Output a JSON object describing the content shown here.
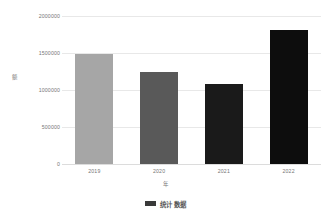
{
  "chart_data": {
    "type": "bar",
    "title": "",
    "categories": [
      "2019",
      "2020",
      "2021",
      "2022"
    ],
    "values": [
      1480000,
      1243000,
      1081000,
      1810000
    ],
    "series": [
      {
        "name": "",
        "values": [
          1480000,
          1243000,
          1081000,
          1810000
        ]
      }
    ],
    "xlabel": "年",
    "ylabel": "额",
    "ylim": [
      0,
      2000000
    ],
    "ytick_labels": [
      "0",
      "500000",
      "1000000",
      "1500000",
      "2000000"
    ],
    "ytick_values": [
      0,
      500000,
      1000000,
      1500000,
      2000000
    ],
    "xtick_labels": [
      "2019",
      "2020",
      "2021",
      "2022"
    ],
    "grid": true,
    "grid_axis": "y",
    "legend": "none",
    "bar_colors": [
      "#a6a6a6",
      "#595959",
      "#1a1a1a",
      "#0d0d0d"
    ]
  },
  "axes": {
    "y_title_chars": [
      "额"
    ],
    "x_title": "年"
  },
  "caption": {
    "text": "统计 数据",
    "swatch_color": "#3a3a3a"
  },
  "colors": {
    "background": "#ffffff",
    "gridline": "#e8e8e8",
    "baseline": "#dcdcdc",
    "tick_text": "#767676"
  }
}
